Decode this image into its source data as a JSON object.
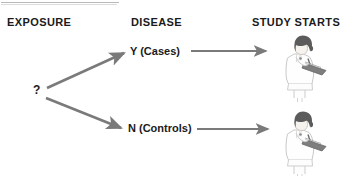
{
  "diagram": {
    "title_partial": "",
    "headers": [
      {
        "id": "exposure",
        "label": "EXPOSURE"
      },
      {
        "id": "disease",
        "label": "DISEASE"
      },
      {
        "id": "study",
        "label": "STUDY STARTS"
      }
    ],
    "nodes": {
      "unknown_exposure": "?",
      "cases": "Y (Cases)",
      "controls": "N (Controls)"
    },
    "colors": {
      "background": "#ffffff",
      "text": "#1b1b1b",
      "arrow": "#7a7a7a",
      "figure_outline": "#c9c9c9",
      "figure_hair": "#555555",
      "figure_clipboard": "#6f6f6f",
      "rule": "#b9b9b9"
    },
    "arrows": [
      {
        "id": "branch-up",
        "from": "?",
        "to": "Y (Cases)",
        "direction": "diagonal-up-right"
      },
      {
        "id": "branch-down",
        "from": "?",
        "to": "N (Controls)",
        "direction": "diagonal-down-right"
      },
      {
        "id": "cases-to-study",
        "from": "Y (Cases)",
        "to": "study-figure-top",
        "direction": "right"
      },
      {
        "id": "controls-to-study",
        "from": "N (Controls)",
        "to": "study-figure-bottom",
        "direction": "right"
      }
    ],
    "figures": [
      {
        "id": "researcher-top",
        "description": "researcher-with-clipboard"
      },
      {
        "id": "researcher-bottom",
        "description": "researcher-with-clipboard"
      }
    ]
  }
}
